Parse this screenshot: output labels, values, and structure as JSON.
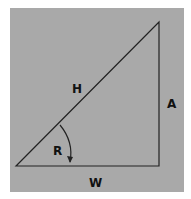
{
  "diagram": {
    "type": "right-triangle",
    "background_color": "#a9a9a9",
    "line_color": "#222222",
    "labels": {
      "hypotenuse": "H",
      "vertical_side": "A",
      "horizontal_side": "W",
      "angle": "R"
    }
  }
}
